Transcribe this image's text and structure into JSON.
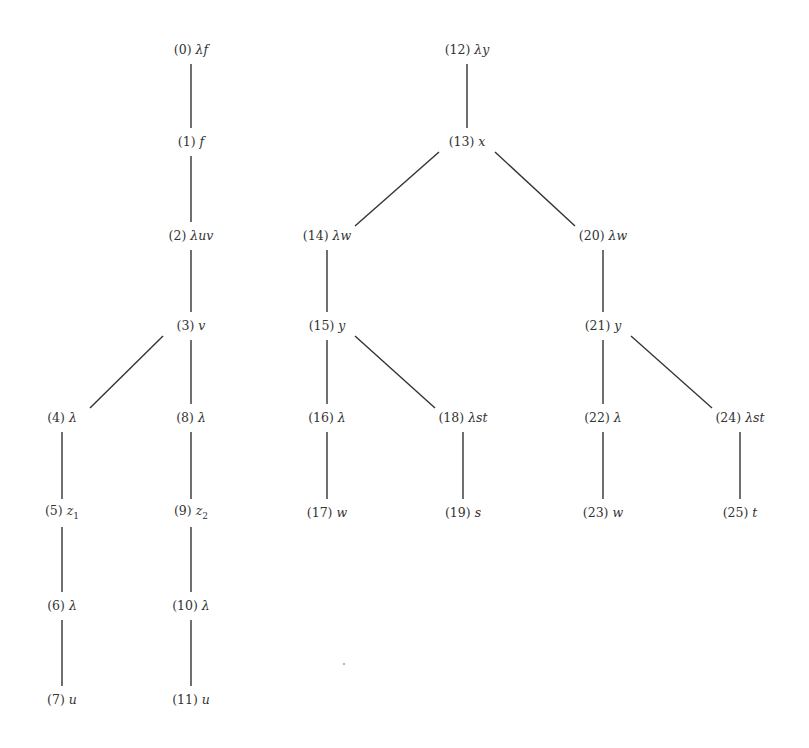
{
  "diagram": {
    "type": "tree",
    "colors": {
      "edge": "#333333",
      "text": "#333333",
      "background": "#ffffff"
    },
    "nodes": [
      {
        "id": 0,
        "index": "(0)",
        "term": "λf",
        "x": 191,
        "y": 50
      },
      {
        "id": 1,
        "index": "(1)",
        "term": "f",
        "x": 191,
        "y": 142
      },
      {
        "id": 2,
        "index": "(2)",
        "term": "λuv",
        "x": 191,
        "y": 236
      },
      {
        "id": 3,
        "index": "(3)",
        "term": "v",
        "x": 191,
        "y": 326
      },
      {
        "id": 4,
        "index": "(4)",
        "term": "λ",
        "x": 62,
        "y": 418
      },
      {
        "id": 5,
        "index": "(5)",
        "term": "z",
        "sub": "1",
        "x": 62,
        "y": 513
      },
      {
        "id": 6,
        "index": "(6)",
        "term": "λ",
        "x": 62,
        "y": 606
      },
      {
        "id": 7,
        "index": "(7)",
        "term": "u",
        "x": 62,
        "y": 700
      },
      {
        "id": 8,
        "index": "(8)",
        "term": "λ",
        "x": 191,
        "y": 418
      },
      {
        "id": 9,
        "index": "(9)",
        "term": "z",
        "sub": "2",
        "x": 191,
        "y": 513
      },
      {
        "id": 10,
        "index": "(10)",
        "term": "λ",
        "x": 191,
        "y": 606
      },
      {
        "id": 11,
        "index": "(11)",
        "term": "u",
        "x": 191,
        "y": 700
      },
      {
        "id": 12,
        "index": "(12)",
        "term": "λy",
        "x": 467,
        "y": 50
      },
      {
        "id": 13,
        "index": "(13)",
        "term": "x",
        "x": 467,
        "y": 142
      },
      {
        "id": 14,
        "index": "(14)",
        "term": "λw",
        "x": 327,
        "y": 236
      },
      {
        "id": 15,
        "index": "(15)",
        "term": "y",
        "x": 327,
        "y": 326
      },
      {
        "id": 16,
        "index": "(16)",
        "term": "λ",
        "x": 327,
        "y": 418
      },
      {
        "id": 17,
        "index": "(17)",
        "term": "w",
        "x": 327,
        "y": 513
      },
      {
        "id": 18,
        "index": "(18)",
        "term": "λst",
        "x": 463,
        "y": 418
      },
      {
        "id": 19,
        "index": "(19)",
        "term": "s",
        "x": 463,
        "y": 513
      },
      {
        "id": 20,
        "index": "(20)",
        "term": "λw",
        "x": 603,
        "y": 236
      },
      {
        "id": 21,
        "index": "(21)",
        "term": "y",
        "x": 603,
        "y": 326
      },
      {
        "id": 22,
        "index": "(22)",
        "term": "λ",
        "x": 603,
        "y": 418
      },
      {
        "id": 23,
        "index": "(23)",
        "term": "w",
        "x": 603,
        "y": 513
      },
      {
        "id": 24,
        "index": "(24)",
        "term": "λst",
        "x": 740,
        "y": 418
      },
      {
        "id": 25,
        "index": "(25)",
        "term": "t",
        "x": 740,
        "y": 513
      }
    ],
    "edges": [
      [
        0,
        1
      ],
      [
        1,
        2
      ],
      [
        2,
        3
      ],
      [
        3,
        4
      ],
      [
        3,
        8
      ],
      [
        4,
        5
      ],
      [
        5,
        6
      ],
      [
        6,
        7
      ],
      [
        8,
        9
      ],
      [
        9,
        10
      ],
      [
        10,
        11
      ],
      [
        12,
        13
      ],
      [
        13,
        14
      ],
      [
        13,
        20
      ],
      [
        14,
        15
      ],
      [
        15,
        16
      ],
      [
        15,
        18
      ],
      [
        16,
        17
      ],
      [
        18,
        19
      ],
      [
        20,
        21
      ],
      [
        21,
        22
      ],
      [
        21,
        24
      ],
      [
        22,
        23
      ],
      [
        24,
        25
      ]
    ]
  }
}
